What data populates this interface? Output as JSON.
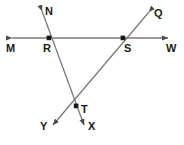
{
  "figure": {
    "type": "geometry-diagram",
    "width": 184,
    "height": 145,
    "background_color": "#ffffff",
    "line_color": "#7a7a7a",
    "label_color": "#1a1a1a",
    "point_color": "#1a1a1a",
    "labels": [
      {
        "id": "N",
        "text": "N",
        "x": 45,
        "y": 6
      },
      {
        "id": "Q",
        "text": "Q",
        "x": 154,
        "y": 8
      },
      {
        "id": "M",
        "text": "M",
        "x": 6,
        "y": 43
      },
      {
        "id": "R",
        "text": "R",
        "x": 43,
        "y": 43
      },
      {
        "id": "S",
        "text": "S",
        "x": 124,
        "y": 43
      },
      {
        "id": "W",
        "text": "W",
        "x": 166,
        "y": 43
      },
      {
        "id": "T",
        "text": "T",
        "x": 81,
        "y": 104
      },
      {
        "id": "Y",
        "text": "Y",
        "x": 40,
        "y": 121
      },
      {
        "id": "X",
        "text": "X",
        "x": 88,
        "y": 121
      }
    ],
    "points": [
      {
        "id": "R",
        "x": 49,
        "y": 38
      },
      {
        "id": "S",
        "x": 123,
        "y": 38
      },
      {
        "id": "T",
        "x": 76,
        "y": 106
      }
    ],
    "lines": [
      {
        "id": "MW",
        "from": "M",
        "to": "W",
        "x1": 12,
        "y1": 38,
        "x2": 168,
        "y2": 38,
        "arrows": "both"
      },
      {
        "id": "NX",
        "from": "N",
        "to": "X",
        "x1": 42,
        "y1": 11,
        "x2": 84,
        "y2": 125,
        "arrows": "both"
      },
      {
        "id": "QY",
        "from": "Q",
        "to": "Y",
        "x1": 149,
        "y1": 12,
        "x2": 53,
        "y2": 125,
        "arrows": "both"
      }
    ]
  }
}
